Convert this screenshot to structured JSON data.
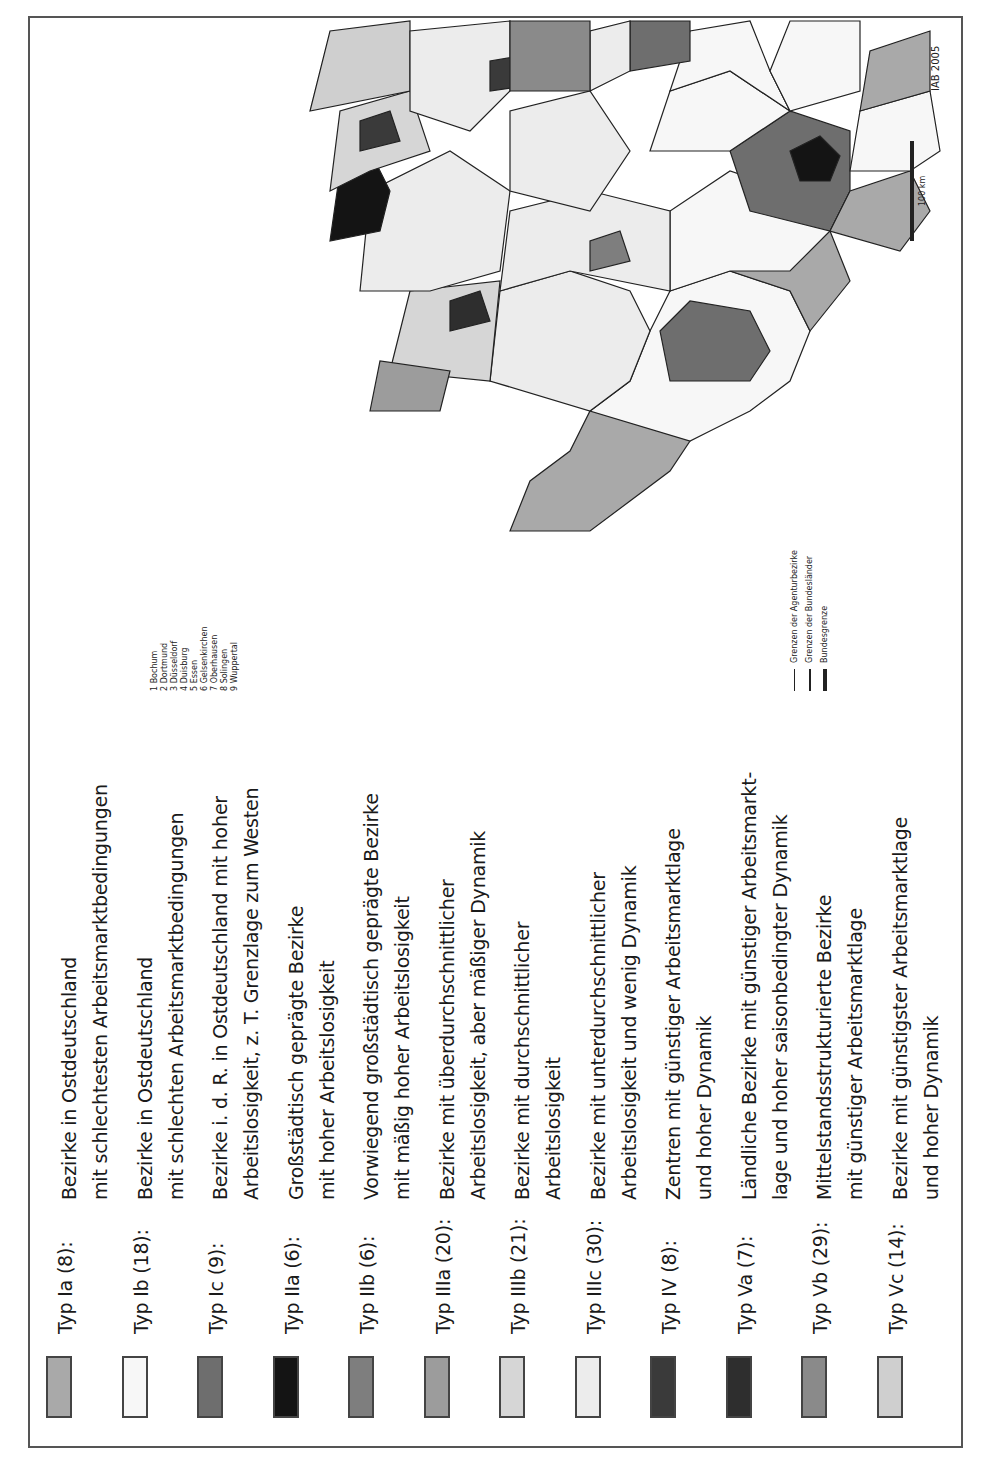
{
  "legend": {
    "items": [
      {
        "type": "Typ Ia (8):",
        "count": 8,
        "color": "#a9a9a9",
        "lines": [
          "Bezirke in Ostdeutschland",
          "mit schlechtesten Arbeitsmarktbedingungen"
        ]
      },
      {
        "type": "Typ Ib (18):",
        "count": 18,
        "color": "#f7f7f7",
        "lines": [
          "Bezirke in Ostdeutschland",
          "mit schlechten Arbeitsmarktbedingungen"
        ]
      },
      {
        "type": "Typ Ic (9):",
        "count": 9,
        "color": "#6e6e6e",
        "lines": [
          "Bezirke i. d. R. in Ostdeutschland mit hoher",
          "Arbeitslosigkeit, z. T. Grenzlage zum Westen"
        ]
      },
      {
        "type": "Typ IIa (6):",
        "count": 6,
        "color": "#141414",
        "lines": [
          "Großstädtisch geprägte Bezirke",
          "mit hoher Arbeitslosigkeit"
        ]
      },
      {
        "type": "Typ IIb (6):",
        "count": 6,
        "color": "#7e7e7e",
        "lines": [
          "Vorwiegend großstädtisch geprägte Bezirke",
          "mit mäßig hoher Arbeitslosigkeit"
        ]
      },
      {
        "type": "Typ IIIa (20):",
        "count": 20,
        "color": "#9c9c9c",
        "lines": [
          "Bezirke mit überdurchschnittlicher",
          "Arbeitslosigkeit, aber mäßiger Dynamik"
        ]
      },
      {
        "type": "Typ IIIb (21):",
        "count": 21,
        "color": "#d6d6d6",
        "lines": [
          "Bezirke mit durchschnittlicher",
          "Arbeitslosigkeit"
        ]
      },
      {
        "type": "Typ IIIc (30):",
        "count": 30,
        "color": "#ececec",
        "lines": [
          "Bezirke mit unterdurchschnittlicher",
          "Arbeitslosigkeit und wenig Dynamik"
        ]
      },
      {
        "type": "Typ IV (8):",
        "count": 8,
        "color": "#3a3a3a",
        "lines": [
          "Zentren mit günstiger Arbeitsmarktlage",
          "und hoher Dynamik"
        ]
      },
      {
        "type": "Typ Va (7):",
        "count": 7,
        "color": "#2e2e2e",
        "lines": [
          "Ländliche Bezirke mit günstiger Arbeitsmarkt-",
          "lage und hoher saisonbedingter Dynamik"
        ]
      },
      {
        "type": "Typ Vb (29):",
        "count": 29,
        "color": "#8a8a8a",
        "lines": [
          "Mittelstandsstrukturierte Bezirke",
          "mit günstiger Arbeitsmarktlage"
        ]
      },
      {
        "type": "Typ Vc (14):",
        "count": 14,
        "color": "#cfcfcf",
        "lines": [
          "Bezirke mit günstigster Arbeitsmarktlage",
          "und hoher Dynamik"
        ]
      }
    ]
  },
  "map": {
    "ruhr_list": [
      "1 Bochum",
      "2 Dortmund",
      "3 Düsseldorf",
      "4 Duisburg",
      "5 Essen",
      "6 Gelsenkirchen",
      "7 Oberhausen",
      "8 Solingen",
      "9 Wuppertal"
    ],
    "boundary_legend": [
      {
        "label": "Grenzen der Agenturbezirke",
        "style": "thin"
      },
      {
        "label": "Grenzen der Bundesländer",
        "style": "medium"
      },
      {
        "label": "Bundesgrenze",
        "style": "thick"
      }
    ],
    "scale_label": "100 km",
    "credit": "IAB 2005",
    "districts": [
      {
        "name": "Flensburg",
        "type": "Vb"
      },
      {
        "name": "Kiel",
        "type": "IIIa"
      },
      {
        "name": "Heide",
        "type": "IIIa"
      },
      {
        "name": "Neumünster",
        "type": "IIIa"
      },
      {
        "name": "Lübeck",
        "type": "IIIa"
      },
      {
        "name": "Bad Oldesloe",
        "type": "IIIc"
      },
      {
        "name": "Elmshorn",
        "type": "IIIb"
      },
      {
        "name": "Hamburg",
        "type": "IIb"
      },
      {
        "name": "Stralsund",
        "type": "Ia"
      },
      {
        "name": "Rostock",
        "type": "Ib"
      },
      {
        "name": "Neubrandenburg",
        "type": "Ia"
      },
      {
        "name": "Schwerin",
        "type": "Ic"
      },
      {
        "name": "Neuruppin",
        "type": "Ib"
      },
      {
        "name": "Eberswalde",
        "type": "Ia"
      },
      {
        "name": "Berlin",
        "type": "IIa"
      },
      {
        "name": "Potsdam",
        "type": "Ic"
      },
      {
        "name": "Frankfurt (Oder)",
        "type": "Ib"
      },
      {
        "name": "Cottbus",
        "type": "Ia"
      },
      {
        "name": "Bautzen",
        "type": "Ia"
      },
      {
        "name": "Dresden",
        "type": "IIb"
      },
      {
        "name": "Riesa",
        "type": "Ib"
      },
      {
        "name": "Pirna",
        "type": "Ib"
      },
      {
        "name": "Chemnitz",
        "type": "Ib"
      },
      {
        "name": "Oschatz",
        "type": "Ib"
      },
      {
        "name": "Leipzig",
        "type": "Ib"
      },
      {
        "name": "Wittenberg",
        "type": "Ib"
      },
      {
        "name": "Dessau",
        "type": "Ib"
      },
      {
        "name": "Halle",
        "type": "Ib"
      },
      {
        "name": "Merseburg",
        "type": "Ia"
      },
      {
        "name": "Sangerhausen",
        "type": "Ia"
      },
      {
        "name": "Magdeburg",
        "type": "Ib"
      },
      {
        "name": "Stendal",
        "type": "Ib"
      },
      {
        "name": "Halberstadt",
        "type": "Ib"
      },
      {
        "name": "Zwickau",
        "type": "Ib"
      },
      {
        "name": "Annaberg",
        "type": "Ib"
      },
      {
        "name": "Plauen",
        "type": "Ic"
      },
      {
        "name": "Gera",
        "type": "Ib"
      },
      {
        "name": "Altenburg",
        "type": "Ib"
      },
      {
        "name": "Jena",
        "type": "Ic"
      },
      {
        "name": "Erfurt",
        "type": "IIIc"
      },
      {
        "name": "Gotha",
        "type": "Ic"
      },
      {
        "name": "Suhl",
        "type": "Ic"
      },
      {
        "name": "Nordhausen",
        "type": "Ib"
      },
      {
        "name": "Bad Hersfeld",
        "type": "IIIa"
      },
      {
        "name": "Uelzen",
        "type": "IIIa"
      },
      {
        "name": "Lüneburg",
        "type": "IIIc"
      },
      {
        "name": "Stade",
        "type": "IIIc"
      },
      {
        "name": "Celle",
        "type": "IIIc"
      },
      {
        "name": "Helmstedt",
        "type": "IIIb"
      },
      {
        "name": "Braunschweig",
        "type": "IIIa"
      },
      {
        "name": "Goslar",
        "type": "IIIa"
      },
      {
        "name": "Hildesheim",
        "type": "IIIb"
      },
      {
        "name": "Hannover",
        "type": "IIb"
      },
      {
        "name": "Hameln",
        "type": "IIIa"
      },
      {
        "name": "Göttingen",
        "type": "IIIb"
      },
      {
        "name": "Northeim",
        "type": "IIIa"
      },
      {
        "name": "Verden",
        "type": "IIIc"
      },
      {
        "name": "Nienburg",
        "type": "IIIc"
      },
      {
        "name": "Bremen",
        "type": "Ic"
      },
      {
        "name": "Bremerhaven",
        "type": "Ic"
      },
      {
        "name": "Oldenburg",
        "type": "IIIb"
      },
      {
        "name": "Vechta",
        "type": "Va"
      },
      {
        "name": "Wilhelmshaven",
        "type": "IIIa"
      },
      {
        "name": "Emden",
        "type": "IIIa"
      },
      {
        "name": "Leer",
        "type": "IIIa"
      },
      {
        "name": "Nordhorn",
        "type": "IIIc"
      },
      {
        "name": "Osnabrück",
        "type": "IIIc"
      },
      {
        "name": "Herford",
        "type": "IIIb"
      },
      {
        "name": "Detmold",
        "type": "IIIb"
      },
      {
        "name": "Bielefeld",
        "type": "IIIc"
      },
      {
        "name": "Paderborn",
        "type": "IIIc"
      },
      {
        "name": "Rheine",
        "type": "Vb"
      },
      {
        "name": "Coesfeld",
        "type": "Vb"
      },
      {
        "name": "Münster",
        "type": "IV"
      },
      {
        "name": "Ahlen",
        "type": "IIIc"
      },
      {
        "name": "Soest",
        "type": "IIIb"
      },
      {
        "name": "Meschede",
        "type": "IIIc"
      },
      {
        "name": "Hamm",
        "type": "IIIa"
      },
      {
        "name": "Recklinghausen",
        "type": "IIIa"
      },
      {
        "name": "Hagen",
        "type": "IIIb"
      },
      {
        "name": "Iserlohn",
        "type": "IIIb"
      },
      {
        "name": "Siegen",
        "type": "IIIc"
      },
      {
        "name": "Wesel",
        "type": "IIIc"
      },
      {
        "name": "Krefeld",
        "type": "IIIb"
      },
      {
        "name": "Mönchengladbach",
        "type": "IIIb"
      },
      {
        "name": "Brühl",
        "type": "IIIc"
      },
      {
        "name": "Köln",
        "type": "IIb"
      },
      {
        "name": "Bonn",
        "type": "IV"
      },
      {
        "name": "Bergisch Gladbach",
        "type": "IIIb"
      },
      {
        "name": "Düren",
        "type": "IIIb"
      },
      {
        "name": "Aachen",
        "type": "IIIb"
      },
      {
        "name": "Kassel",
        "type": "IIIa"
      },
      {
        "name": "Korbach",
        "type": "IIIc"
      },
      {
        "name": "Marburg",
        "type": "IIIc"
      },
      {
        "name": "Fulda",
        "type": "IIIc"
      },
      {
        "name": "Gießen",
        "type": "IIIc"
      },
      {
        "name": "Wetzlar",
        "type": "IIIc"
      },
      {
        "name": "Limburg",
        "type": "IIIb"
      },
      {
        "name": "Montabaur",
        "type": "Vb"
      },
      {
        "name": "Neuwied",
        "type": "IIIc"
      },
      {
        "name": "Mayen",
        "type": "IIIc"
      },
      {
        "name": "Koblenz",
        "type": "IIIb"
      },
      {
        "name": "Bad Kreuznach",
        "type": "IIIc"
      },
      {
        "name": "Trier",
        "type": "Vc"
      },
      {
        "name": "Frankfurt",
        "type": "IV"
      },
      {
        "name": "Wiesbaden",
        "type": "IIIc"
      },
      {
        "name": "Offenbach",
        "type": "IIIb"
      },
      {
        "name": "Hanau",
        "type": "Vb"
      },
      {
        "name": "Darmstadt",
        "type": "Vb"
      },
      {
        "name": "Mainz",
        "type": "Vb"
      },
      {
        "name": "Aschaffenburg",
        "type": "Vb"
      },
      {
        "name": "Mannheim",
        "type": "IV"
      },
      {
        "name": "Ludwigshafen",
        "type": "IIIb"
      },
      {
        "name": "Kaiserslautern",
        "type": "IIIb"
      },
      {
        "name": "Landau",
        "type": "Vb"
      },
      {
        "name": "Pirmasens",
        "type": "IIIa"
      },
      {
        "name": "Neunkirchen",
        "type": "IIIb"
      },
      {
        "name": "Saarbrücken",
        "type": "IIIa"
      },
      {
        "name": "Saarlouis",
        "type": "IIIb"
      },
      {
        "name": "Schweinfurt",
        "type": "IIIc"
      },
      {
        "name": "Würzburg",
        "type": "Vc"
      },
      {
        "name": "Bamberg",
        "type": "Vc"
      },
      {
        "name": "Coburg",
        "type": "IIIb"
      },
      {
        "name": "Bayreuth",
        "type": "IIIb"
      },
      {
        "name": "Hof",
        "type": "IIIa"
      },
      {
        "name": "Weiden",
        "type": "Vc"
      },
      {
        "name": "Schwandorf",
        "type": "Va"
      },
      {
        "name": "Nürnberg",
        "type": "IV"
      },
      {
        "name": "Ansbach",
        "type": "Va"
      },
      {
        "name": "Regensburg",
        "type": "Vc"
      },
      {
        "name": "Weißenburg",
        "type": "Vc"
      },
      {
        "name": "Ingolstadt",
        "type": "Vc"
      },
      {
        "name": "Deggendorf",
        "type": "Va"
      },
      {
        "name": "Passau",
        "type": "Va"
      },
      {
        "name": "Landshut",
        "type": "Vc"
      },
      {
        "name": "Pfarrkirchen",
        "type": "Va"
      },
      {
        "name": "Freising",
        "type": "Vc"
      },
      {
        "name": "München",
        "type": "IV"
      },
      {
        "name": "Traunstein",
        "type": "Va"
      },
      {
        "name": "Rosenheim",
        "type": "Vc"
      },
      {
        "name": "Weilheim",
        "type": "Vc"
      },
      {
        "name": "Augsburg",
        "type": "Vc"
      },
      {
        "name": "Donauwörth",
        "type": "Vc"
      },
      {
        "name": "Memmingen",
        "type": "Vc"
      },
      {
        "name": "Kempten",
        "type": "Vc"
      },
      {
        "name": "Tauberbischofsheim",
        "type": "Vb"
      },
      {
        "name": "Schwäb. Hall",
        "type": "Vb"
      },
      {
        "name": "Aalen",
        "type": "Vb"
      },
      {
        "name": "Heilbronn",
        "type": "Vb"
      },
      {
        "name": "Ludwigsburg",
        "type": "Vb"
      },
      {
        "name": "Waiblingen",
        "type": "Vb"
      },
      {
        "name": "Göppingen",
        "type": "Vb"
      },
      {
        "name": "Stuttgart",
        "type": "IV"
      },
      {
        "name": "Ulm",
        "type": "Vb"
      },
      {
        "name": "Reutlingen",
        "type": "Vb"
      },
      {
        "name": "Nagold",
        "type": "Vb"
      },
      {
        "name": "Pforzheim",
        "type": "Vb"
      },
      {
        "name": "Karlsruhe",
        "type": "Vb"
      },
      {
        "name": "Rastatt",
        "type": "Vb"
      },
      {
        "name": "Offenburg",
        "type": "Vb"
      },
      {
        "name": "Balingen",
        "type": "Vb"
      },
      {
        "name": "Ravensburg",
        "type": "Vc"
      },
      {
        "name": "Rottweil",
        "type": "Vb"
      },
      {
        "name": "Villingen-Schwenningen",
        "type": "Vb"
      },
      {
        "name": "Konstanz",
        "type": "Vb"
      },
      {
        "name": "Freiburg",
        "type": "Vb"
      },
      {
        "name": "Lörrach",
        "type": "Vb"
      }
    ]
  }
}
